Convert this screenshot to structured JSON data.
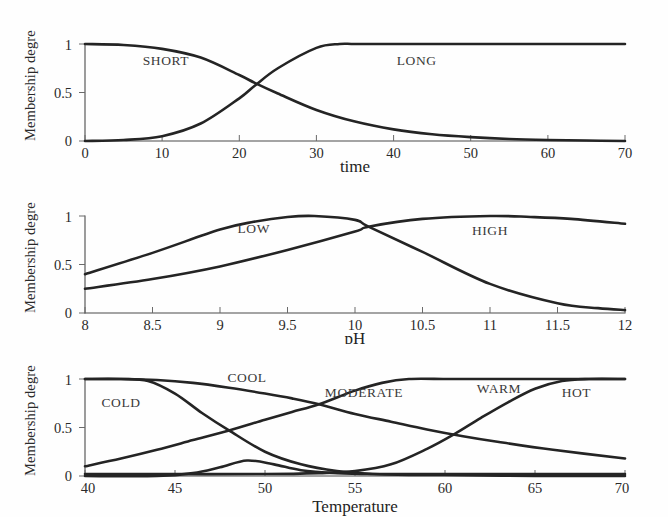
{
  "figure": {
    "background_color": "#fefefe",
    "curve_color": "#242424",
    "axis_color": "#4a4a4a",
    "text_color": "#2a2a2a",
    "shared_ylabel": "Membership degre",
    "shared_yticks": [
      "0",
      "0.5",
      "1"
    ]
  },
  "chart_data": [
    {
      "type": "line",
      "id": "time",
      "title": "",
      "xlabel": "time",
      "ylabel": "Membership degre",
      "xlim": [
        0,
        70
      ],
      "ylim": [
        0,
        1.05
      ],
      "xticks": [
        0,
        10,
        20,
        30,
        40,
        50,
        60,
        70
      ],
      "xticklabels": [
        "0",
        "10",
        "20",
        "30",
        "40",
        "50",
        "60",
        "70"
      ],
      "yticks": [
        0,
        0.5,
        1
      ],
      "yticklabels": [
        "0",
        "0.5",
        "1"
      ],
      "grid": false,
      "legend_position": "inline-annotations",
      "annotations": [
        {
          "text": "SHORT",
          "x": 10.5,
          "y": 0.78
        },
        {
          "text": "LONG",
          "x": 43.0,
          "y": 0.78
        }
      ],
      "series": [
        {
          "name": "SHORT",
          "x": [
            0,
            5,
            10,
            15,
            20,
            22,
            25,
            30,
            35,
            40,
            45,
            50,
            55,
            60,
            65,
            70
          ],
          "values": [
            1.0,
            0.99,
            0.95,
            0.86,
            0.68,
            0.6,
            0.49,
            0.32,
            0.2,
            0.12,
            0.07,
            0.04,
            0.02,
            0.01,
            0.005,
            0.0
          ]
        },
        {
          "name": "LONG",
          "x": [
            0,
            5,
            10,
            15,
            20,
            22,
            25,
            30,
            33,
            35,
            40,
            45,
            50,
            55,
            60,
            65,
            70
          ],
          "values": [
            0.0,
            0.01,
            0.05,
            0.18,
            0.44,
            0.57,
            0.75,
            0.96,
            1.0,
            1.0,
            1.0,
            1.0,
            1.0,
            1.0,
            1.0,
            1.0,
            1.0
          ]
        }
      ],
      "crossover": {
        "x": 21.8,
        "y": 0.56
      }
    },
    {
      "type": "line",
      "id": "ph",
      "title": "",
      "xlabel": "pH",
      "ylabel": "Membership degre",
      "xlim": [
        8,
        12
      ],
      "ylim": [
        0,
        1.05
      ],
      "xticks": [
        8,
        8.5,
        9,
        9.5,
        10,
        10.5,
        11,
        11.5,
        12
      ],
      "xticklabels": [
        "8",
        "8.5",
        "9",
        "9.5",
        "10",
        "10.5",
        "11",
        "11.5",
        "12"
      ],
      "yticks": [
        0,
        0.5,
        1
      ],
      "yticklabels": [
        "0",
        "0.5",
        "1"
      ],
      "grid": false,
      "legend_position": "inline-annotations",
      "annotations": [
        {
          "text": "LOW",
          "x": 9.25,
          "y": 0.83
        },
        {
          "text": "HIGH",
          "x": 11.0,
          "y": 0.8
        }
      ],
      "series": [
        {
          "name": "LOW",
          "x": [
            8,
            8.5,
            9,
            9.25,
            9.5,
            9.7,
            10,
            10.1,
            10.5,
            11,
            11.5,
            11.8,
            12
          ],
          "values": [
            0.4,
            0.62,
            0.86,
            0.94,
            0.99,
            1.0,
            0.96,
            0.89,
            0.63,
            0.3,
            0.1,
            0.05,
            0.03
          ]
        },
        {
          "name": "HIGH",
          "x": [
            8,
            8.5,
            9,
            9.5,
            10,
            10.1,
            10.5,
            11,
            11.3,
            11.6,
            12
          ],
          "values": [
            0.25,
            0.35,
            0.48,
            0.65,
            0.84,
            0.89,
            0.97,
            1.0,
            0.99,
            0.97,
            0.92
          ]
        }
      ],
      "crossover": {
        "x": 10.1,
        "y": 0.885
      }
    },
    {
      "type": "line",
      "id": "temperature",
      "title": "",
      "xlabel": "Temperature",
      "ylabel": "Membership degre",
      "xlim": [
        40,
        70
      ],
      "ylim": [
        0,
        1.05
      ],
      "xticks": [
        40,
        45,
        50,
        55,
        60,
        65,
        70
      ],
      "xticklabels": [
        "40",
        "45",
        "50",
        "55",
        "60",
        "65",
        "70"
      ],
      "yticks": [
        0,
        0.5,
        1
      ],
      "yticklabels": [
        "0",
        "0.5",
        "1"
      ],
      "grid": false,
      "legend_position": "inline-annotations",
      "annotations": [
        {
          "text": "COLD",
          "x": 42.0,
          "y": 0.71
        },
        {
          "text": "COOL",
          "x": 49.0,
          "y": 0.97
        },
        {
          "text": "MODERATE",
          "x": 55.5,
          "y": 0.82
        },
        {
          "text": "WARM",
          "x": 63.0,
          "y": 0.86
        },
        {
          "text": "HOT",
          "x": 67.3,
          "y": 0.82
        }
      ],
      "series": [
        {
          "name": "COLD",
          "x": [
            40,
            42,
            43.5,
            45,
            46.5,
            48,
            50,
            52,
            54,
            56,
            58,
            60,
            65,
            70
          ],
          "values": [
            1.0,
            1.0,
            0.98,
            0.85,
            0.65,
            0.47,
            0.25,
            0.12,
            0.05,
            0.02,
            0.01,
            0.01,
            0.0,
            0.0
          ]
        },
        {
          "name": "COOL",
          "x": [
            40,
            42,
            44,
            46,
            48,
            50,
            51.5,
            53,
            55,
            57,
            59,
            61,
            63,
            66,
            70
          ],
          "values": [
            1.0,
            1.0,
            0.99,
            0.96,
            0.91,
            0.85,
            0.8,
            0.74,
            0.64,
            0.56,
            0.48,
            0.41,
            0.35,
            0.27,
            0.18
          ]
        },
        {
          "name": "MODERATE",
          "x": [
            40,
            42,
            44,
            46,
            48,
            50,
            51.5,
            53,
            55,
            56.5,
            58,
            60,
            61.5,
            63,
            65,
            67,
            70
          ],
          "values": [
            0.1,
            0.18,
            0.27,
            0.37,
            0.47,
            0.58,
            0.66,
            0.74,
            0.88,
            0.96,
            1.0,
            1.0,
            1.0,
            1.0,
            1.0,
            1.0,
            1.0
          ]
        },
        {
          "name": "WARM",
          "x": [
            40,
            44,
            46,
            47.5,
            49,
            50.5,
            52,
            54,
            56,
            58,
            60,
            61.5,
            63,
            65,
            67,
            70
          ],
          "values": [
            0.0,
            0.0,
            0.03,
            0.09,
            0.16,
            0.12,
            0.06,
            0.03,
            0.02,
            0.02,
            0.02,
            0.02,
            0.02,
            0.02,
            0.02,
            0.02
          ]
        },
        {
          "name": "HOT",
          "x": [
            40,
            45,
            50,
            53,
            55,
            57,
            59,
            60.5,
            62,
            63.5,
            65,
            66.5,
            68,
            70
          ],
          "values": [
            0.02,
            0.02,
            0.02,
            0.03,
            0.05,
            0.12,
            0.28,
            0.43,
            0.6,
            0.76,
            0.9,
            0.98,
            1.0,
            1.0
          ]
        }
      ]
    }
  ]
}
